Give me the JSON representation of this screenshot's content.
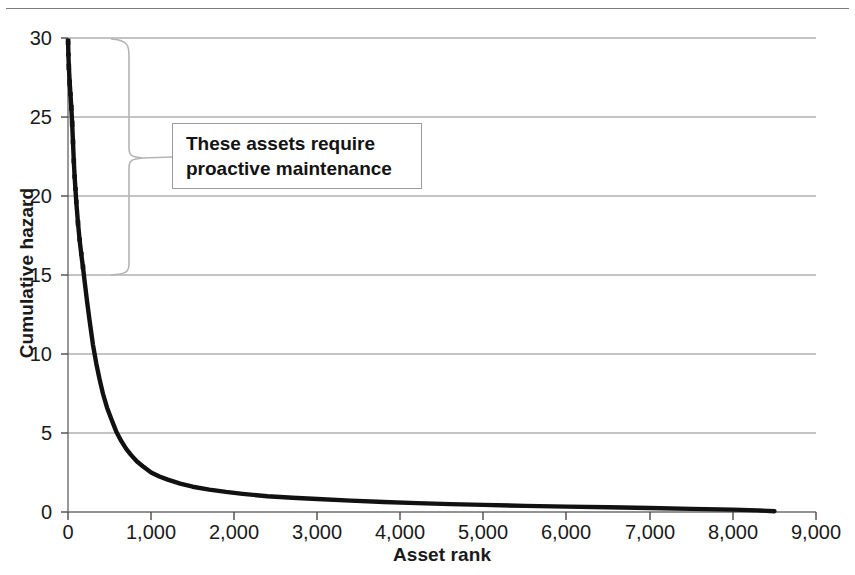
{
  "chart_data": {
    "type": "line",
    "title": "",
    "xlabel": "Asset rank",
    "ylabel": "Cumulative hazard",
    "xlim": [
      0,
      9000
    ],
    "ylim": [
      0,
      30
    ],
    "xticks": [
      "0",
      "1,000",
      "2,000",
      "3,000",
      "4,000",
      "5,000",
      "6,000",
      "7,000",
      "8,000",
      "9,000"
    ],
    "xtick_values": [
      0,
      1000,
      2000,
      3000,
      4000,
      5000,
      6000,
      7000,
      8000,
      9000
    ],
    "yticks": [
      "0",
      "5",
      "10",
      "15",
      "20",
      "25",
      "30"
    ],
    "ytick_values": [
      0,
      5,
      10,
      15,
      20,
      25,
      30
    ],
    "grid": "horizontal",
    "legend": "none",
    "series": [
      {
        "name": "Cumulative hazard by asset rank",
        "style": "thick-black-line",
        "x": [
          1,
          5,
          10,
          20,
          30,
          40,
          50,
          60,
          70,
          80,
          90,
          100,
          120,
          140,
          160,
          180,
          200,
          230,
          260,
          300,
          340,
          380,
          420,
          470,
          520,
          580,
          640,
          700,
          760,
          830,
          900,
          1000,
          1100,
          1200,
          1350,
          1500,
          1700,
          1900,
          2100,
          2400,
          2700,
          3000,
          3400,
          3800,
          4200,
          4600,
          5000,
          5500,
          6000,
          6500,
          7000,
          7500,
          8000,
          8300,
          8500
        ],
        "y": [
          29.8,
          28.9,
          28.2,
          27.2,
          26.4,
          25.6,
          24.6,
          23.4,
          22.2,
          21.2,
          20.4,
          19.6,
          18.3,
          17.2,
          16.3,
          15.5,
          14.6,
          13.3,
          12.1,
          10.6,
          9.4,
          8.4,
          7.5,
          6.6,
          5.9,
          5.1,
          4.5,
          4.0,
          3.6,
          3.2,
          2.9,
          2.5,
          2.25,
          2.05,
          1.8,
          1.6,
          1.42,
          1.27,
          1.15,
          1.0,
          0.9,
          0.82,
          0.72,
          0.63,
          0.56,
          0.5,
          0.45,
          0.39,
          0.34,
          0.3,
          0.25,
          0.2,
          0.15,
          0.1,
          0.05
        ]
      }
    ],
    "annotations": [
      {
        "name": "brace-annotation",
        "text_lines": [
          "These assets require",
          "proactive maintenance"
        ],
        "brace_y_range": [
          15,
          30
        ],
        "brace_x": 480,
        "points_to": "top-ranked assets"
      }
    ],
    "colors": {
      "curve": "#111111",
      "grid": "#8a8a8a",
      "axis": "#6e6e6e",
      "brace": "#b4b4b4",
      "callout_border": "#9b9b9b",
      "text": "#1a1a1a",
      "background": "#ffffff"
    }
  }
}
